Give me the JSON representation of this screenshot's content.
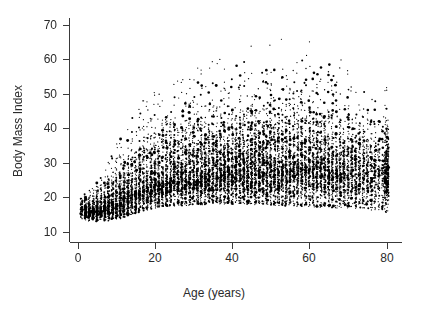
{
  "chart_data": {
    "type": "scatter",
    "title": "",
    "xlabel": "Age (years)",
    "ylabel": "Body Mass Index",
    "xlim": [
      -2,
      84
    ],
    "ylim": [
      7,
      72
    ],
    "xticks": [
      0,
      20,
      40,
      60,
      80
    ],
    "xtick_labels": [
      "0",
      "20",
      "40",
      "60",
      "80"
    ],
    "yticks": [
      10,
      20,
      30,
      40,
      50,
      60,
      70
    ],
    "ytick_labels": [
      "10",
      "20",
      "30",
      "40",
      "50",
      "60",
      "70"
    ],
    "grid": false,
    "legend": false,
    "point_color": "#000000",
    "background_color": "#ffffff",
    "axis_color": "#3a3a3a",
    "marker": "filled-circle",
    "marker_size_px": 1.6,
    "n_points_approx": 9000,
    "age_profile": [
      {
        "age": 1,
        "median": 16.4,
        "p10": 14.8,
        "p90": 18.2,
        "max": 20.5,
        "min": 13.4,
        "count": 60
      },
      {
        "age": 2,
        "median": 16.2,
        "p10": 14.6,
        "p90": 18.0,
        "max": 21.0,
        "min": 13.2,
        "count": 95
      },
      {
        "age": 3,
        "median": 16.0,
        "p10": 14.5,
        "p90": 17.9,
        "max": 22.0,
        "min": 13.0,
        "count": 110
      },
      {
        "age": 4,
        "median": 15.9,
        "p10": 14.4,
        "p90": 18.1,
        "max": 23.0,
        "min": 12.9,
        "count": 115
      },
      {
        "age": 5,
        "median": 16.0,
        "p10": 14.4,
        "p90": 18.6,
        "max": 24.5,
        "min": 12.8,
        "count": 120
      },
      {
        "age": 6,
        "median": 16.2,
        "p10": 14.5,
        "p90": 19.4,
        "max": 26.0,
        "min": 12.8,
        "count": 120
      },
      {
        "age": 7,
        "median": 16.6,
        "p10": 14.6,
        "p90": 20.4,
        "max": 28.0,
        "min": 12.9,
        "count": 125
      },
      {
        "age": 8,
        "median": 17.0,
        "p10": 14.8,
        "p90": 21.6,
        "max": 30.5,
        "min": 13.0,
        "count": 125
      },
      {
        "age": 9,
        "median": 17.5,
        "p10": 15.0,
        "p90": 22.8,
        "max": 33.0,
        "min": 13.2,
        "count": 125
      },
      {
        "age": 10,
        "median": 18.1,
        "p10": 15.3,
        "p90": 24.0,
        "max": 35.5,
        "min": 13.4,
        "count": 125
      },
      {
        "age": 11,
        "median": 18.8,
        "p10": 15.6,
        "p90": 25.2,
        "max": 37.5,
        "min": 13.7,
        "count": 125
      },
      {
        "age": 12,
        "median": 19.5,
        "p10": 16.0,
        "p90": 26.3,
        "max": 39.0,
        "min": 14.0,
        "count": 125
      },
      {
        "age": 13,
        "median": 20.2,
        "p10": 16.4,
        "p90": 27.2,
        "max": 41.0,
        "min": 14.4,
        "count": 125
      },
      {
        "age": 14,
        "median": 20.9,
        "p10": 16.9,
        "p90": 28.0,
        "max": 43.0,
        "min": 14.8,
        "count": 125
      },
      {
        "age": 15,
        "median": 21.5,
        "p10": 17.3,
        "p90": 28.8,
        "max": 45.0,
        "min": 15.2,
        "count": 125
      },
      {
        "age": 16,
        "median": 22.1,
        "p10": 17.8,
        "p90": 29.5,
        "max": 46.5,
        "min": 15.6,
        "count": 125
      },
      {
        "age": 17,
        "median": 22.6,
        "p10": 18.2,
        "p90": 30.2,
        "max": 48.0,
        "min": 16.0,
        "count": 125
      },
      {
        "age": 18,
        "median": 23.1,
        "p10": 18.6,
        "p90": 30.8,
        "max": 49.0,
        "min": 16.3,
        "count": 125
      },
      {
        "age": 19,
        "median": 23.5,
        "p10": 18.9,
        "p90": 31.3,
        "max": 50.0,
        "min": 16.6,
        "count": 125
      },
      {
        "age": 20,
        "median": 23.9,
        "p10": 19.2,
        "p90": 31.8,
        "max": 51.0,
        "min": 16.8,
        "count": 130
      },
      {
        "age": 22,
        "median": 24.5,
        "p10": 19.6,
        "p90": 32.6,
        "max": 52.5,
        "min": 17.1,
        "count": 130
      },
      {
        "age": 25,
        "median": 25.3,
        "p10": 20.0,
        "p90": 33.6,
        "max": 54.0,
        "min": 17.4,
        "count": 135
      },
      {
        "age": 28,
        "median": 25.9,
        "p10": 20.3,
        "p90": 34.3,
        "max": 55.5,
        "min": 17.6,
        "count": 135
      },
      {
        "age": 30,
        "median": 26.3,
        "p10": 20.5,
        "p90": 34.8,
        "max": 57.0,
        "min": 17.7,
        "count": 140
      },
      {
        "age": 33,
        "median": 26.8,
        "p10": 20.8,
        "p90": 35.3,
        "max": 58.5,
        "min": 17.9,
        "count": 140
      },
      {
        "age": 36,
        "median": 27.2,
        "p10": 21.0,
        "p90": 35.8,
        "max": 60.0,
        "min": 18.0,
        "count": 140
      },
      {
        "age": 40,
        "median": 27.6,
        "p10": 21.2,
        "p90": 36.2,
        "max": 62.0,
        "min": 18.0,
        "count": 145
      },
      {
        "age": 44,
        "median": 27.9,
        "p10": 21.3,
        "p90": 36.5,
        "max": 63.5,
        "min": 17.9,
        "count": 145
      },
      {
        "age": 48,
        "median": 28.2,
        "p10": 21.4,
        "p90": 36.8,
        "max": 65.0,
        "min": 17.8,
        "count": 145
      },
      {
        "age": 52,
        "median": 28.4,
        "p10": 21.4,
        "p90": 36.9,
        "max": 66.0,
        "min": 17.6,
        "count": 140
      },
      {
        "age": 56,
        "median": 28.5,
        "p10": 21.4,
        "p90": 36.8,
        "max": 66.5,
        "min": 17.4,
        "count": 140
      },
      {
        "age": 60,
        "median": 28.5,
        "p10": 21.3,
        "p90": 36.5,
        "max": 67.0,
        "min": 17.2,
        "count": 135
      },
      {
        "age": 64,
        "median": 28.3,
        "p10": 21.1,
        "p90": 36.0,
        "max": 64.0,
        "min": 17.0,
        "count": 130
      },
      {
        "age": 68,
        "median": 28.0,
        "p10": 20.9,
        "p90": 35.2,
        "max": 60.0,
        "min": 16.8,
        "count": 120
      },
      {
        "age": 72,
        "median": 27.6,
        "p10": 20.6,
        "p90": 34.2,
        "max": 55.0,
        "min": 16.5,
        "count": 105
      },
      {
        "age": 76,
        "median": 27.1,
        "p10": 20.2,
        "p90": 33.0,
        "max": 50.0,
        "min": 16.2,
        "count": 85
      },
      {
        "age": 79,
        "median": 26.7,
        "p10": 19.9,
        "p90": 32.0,
        "max": 46.0,
        "min": 16.0,
        "count": 60
      },
      {
        "age": 80,
        "median": 26.8,
        "p10": 20.0,
        "p90": 34.0,
        "max": 52.0,
        "min": 15.5,
        "count": 320
      }
    ]
  }
}
